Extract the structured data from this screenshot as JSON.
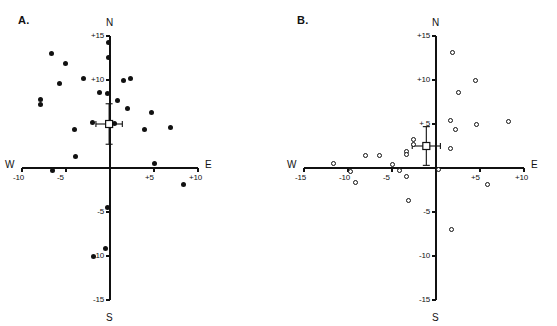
{
  "figure": {
    "background_color": "#ffffff",
    "ink_color": "#111111",
    "width": 557,
    "height": 326
  },
  "panels": [
    {
      "id": "a",
      "label": "A.",
      "label_pos": {
        "x": 18,
        "y": 14
      },
      "origin": {
        "x": 110,
        "y": 168
      },
      "units_per_px": 8.8,
      "axis": {
        "x_min": -10,
        "x_max": 10,
        "y_min": -15,
        "y_max": 15,
        "x_left_label": "W",
        "x_right_label": "E",
        "y_top_label": "N",
        "y_bottom_label": "S",
        "x_ticks": [
          {
            "value": -10,
            "label": "-10"
          },
          {
            "value": -5,
            "label": "-5"
          },
          {
            "value": 5,
            "label": "+5"
          },
          {
            "value": 10,
            "label": "+10"
          }
        ],
        "y_ticks": [
          {
            "value": 15,
            "label": "+15"
          },
          {
            "value": 10,
            "label": "+10"
          },
          {
            "value": -5,
            "label": "-5"
          },
          {
            "value": -10,
            "label": "-10"
          },
          {
            "value": -15,
            "label": "-15"
          }
        ]
      },
      "marker_style": "filled-circle",
      "mean": {
        "x": -0.1,
        "y": 5.0,
        "error_x": 1.5,
        "error_y": 2.3,
        "style": "open-square-with-error-bars"
      }
    },
    {
      "id": "b",
      "label": "B.",
      "label_pos": {
        "x": 297,
        "y": 14
      },
      "origin": {
        "x": 436,
        "y": 168
      },
      "units_per_px": 8.8,
      "axis": {
        "x_min": -15,
        "x_max": 10,
        "y_min": -15,
        "y_max": 15,
        "x_left_label": "W",
        "x_right_label": "E",
        "y_top_label": "N",
        "y_bottom_label": "S",
        "x_ticks": [
          {
            "value": -15,
            "label": "-15"
          },
          {
            "value": -10,
            "label": "-10"
          },
          {
            "value": -5,
            "label": "-5"
          },
          {
            "value": 5,
            "label": "+5"
          },
          {
            "value": 10,
            "label": "+10"
          }
        ],
        "y_ticks": [
          {
            "value": 15,
            "label": "+15"
          },
          {
            "value": 10,
            "label": "+10"
          },
          {
            "value": 5,
            "label": "+ 5"
          },
          {
            "value": -5,
            "label": "-5"
          },
          {
            "value": -10,
            "label": "-10"
          },
          {
            "value": -15,
            "label": "-15"
          }
        ]
      },
      "marker_style": "open-circle",
      "mean": {
        "x": -1.1,
        "y": 2.5,
        "error_x": 1.6,
        "error_y": 2.2,
        "style": "open-square-with-error-bars"
      }
    }
  ],
  "chart_data": [
    {
      "type": "scatter",
      "panel": "A",
      "title": "A.",
      "xlabel": "W - E",
      "ylabel": "S - N",
      "xlim": [
        -10,
        10
      ],
      "ylim": [
        -15,
        15
      ],
      "grid": false,
      "legend": "none",
      "marker": "filled circle",
      "xtick_labels": [
        "-10",
        "-5",
        "+5",
        "+10"
      ],
      "ytick_labels": [
        "+15",
        "+10",
        "-5",
        "-10",
        "-15"
      ],
      "points": [
        [
          -6.7,
          13.0
        ],
        [
          -5.1,
          11.9
        ],
        [
          -0.2,
          14.3
        ],
        [
          -0.2,
          12.6
        ],
        [
          -3.0,
          10.2
        ],
        [
          1.5,
          10.0
        ],
        [
          2.3,
          10.2
        ],
        [
          -5.7,
          9.6
        ],
        [
          -1.2,
          8.6
        ],
        [
          -0.3,
          8.5
        ],
        [
          -7.9,
          7.8
        ],
        [
          -7.9,
          7.2
        ],
        [
          0.8,
          7.7
        ],
        [
          2.0,
          6.8
        ],
        [
          -2.0,
          5.2
        ],
        [
          0.5,
          5.1
        ],
        [
          4.7,
          6.3
        ],
        [
          -4.0,
          4.4
        ],
        [
          3.9,
          4.4
        ],
        [
          6.9,
          4.6
        ],
        [
          -3.9,
          1.3
        ],
        [
          -6.5,
          -0.3
        ],
        [
          5.1,
          0.5
        ],
        [
          8.3,
          -1.9
        ],
        [
          -0.3,
          -4.5
        ],
        [
          -0.5,
          -9.1
        ],
        [
          -1.9,
          -10.1
        ]
      ],
      "mean_point": [
        -0.1,
        5.0
      ],
      "mean_error_x": 1.5,
      "mean_error_y": 2.3
    },
    {
      "type": "scatter",
      "panel": "B",
      "title": "B.",
      "xlabel": "W - E",
      "ylabel": "S - N",
      "xlim": [
        -15,
        10
      ],
      "ylim": [
        -15,
        15
      ],
      "grid": false,
      "legend": "none",
      "marker": "open circle",
      "xtick_labels": [
        "-15",
        "-10",
        "-5",
        "+5",
        "+10"
      ],
      "ytick_labels": [
        "+15",
        "+10",
        "+ 5",
        "-5",
        "-10",
        "-15"
      ],
      "points": [
        [
          1.9,
          13.1
        ],
        [
          4.5,
          10.0
        ],
        [
          2.5,
          8.6
        ],
        [
          1.6,
          5.4
        ],
        [
          4.6,
          5.0
        ],
        [
          8.2,
          5.3
        ],
        [
          2.2,
          4.4
        ],
        [
          1.6,
          2.2
        ],
        [
          -2.6,
          3.2
        ],
        [
          -2.6,
          2.7
        ],
        [
          -3.3,
          1.9
        ],
        [
          -3.4,
          1.5
        ],
        [
          -8.0,
          1.4
        ],
        [
          -6.4,
          1.4
        ],
        [
          -11.6,
          0.5
        ],
        [
          -9.7,
          -0.4
        ],
        [
          -4.9,
          0.4
        ],
        [
          -4.1,
          -0.3
        ],
        [
          -3.4,
          -1.0
        ],
        [
          0.3,
          -0.2
        ],
        [
          -9.2,
          -1.6
        ],
        [
          5.8,
          -1.9
        ],
        [
          -3.1,
          -3.7
        ],
        [
          1.8,
          -7.0
        ]
      ],
      "mean_point": [
        -1.1,
        2.5
      ],
      "mean_error_x": 1.6,
      "mean_error_y": 2.2
    }
  ]
}
